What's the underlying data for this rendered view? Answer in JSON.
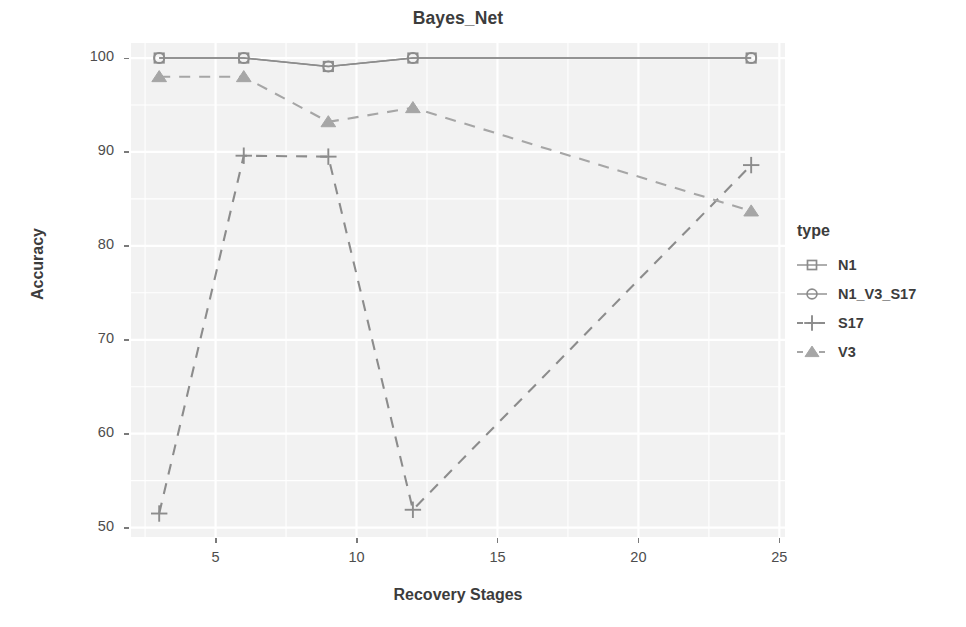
{
  "chart_data": {
    "type": "line",
    "title": "Bayes_Net",
    "xlabel": "Recovery Stages",
    "ylabel": "Accuracy",
    "legend_title": "type",
    "legend_position": "right",
    "grid": true,
    "xlim": [
      2.0,
      25.2
    ],
    "ylim": [
      49.0,
      101.6
    ],
    "xticks": [
      5,
      10,
      15,
      20,
      25
    ],
    "yticks": [
      50,
      60,
      70,
      80,
      90,
      100
    ],
    "x": [
      3,
      6,
      9,
      12,
      24
    ],
    "series": [
      {
        "name": "N1",
        "marker": "square",
        "linestyle": "solid",
        "color": "#8c8c8c",
        "values": [
          100.0,
          100.0,
          99.1,
          100.0,
          100.0
        ]
      },
      {
        "name": "N1_V3_S17",
        "marker": "circle",
        "linestyle": "solid",
        "color": "#8c8c8c",
        "values": [
          100.0,
          100.0,
          99.1,
          100.0,
          100.0
        ]
      },
      {
        "name": "S17",
        "marker": "plus",
        "linestyle": "dashed",
        "color": "#8c8c8c",
        "values": [
          51.5,
          89.6,
          89.5,
          51.9,
          88.6
        ]
      },
      {
        "name": "V3",
        "marker": "triangle",
        "linestyle": "dashed",
        "color": "#a6a6a6",
        "values": [
          98.0,
          98.0,
          93.2,
          94.7,
          83.7
        ]
      }
    ]
  },
  "panel": {
    "background_color": "#f2f2f2",
    "gridline_color": "#ffffff"
  },
  "legend": {
    "title": "type",
    "items": [
      {
        "label": "N1",
        "marker": "square-marker"
      },
      {
        "label": "N1_V3_S17",
        "marker": "circle-marker"
      },
      {
        "label": "S17",
        "marker": "plus-marker"
      },
      {
        "label": "V3",
        "marker": "triangle-marker"
      }
    ]
  },
  "axes": {
    "y_tick_labels": [
      "100",
      "90",
      "80",
      "70",
      "60",
      "50"
    ],
    "x_tick_labels": [
      "5",
      "10",
      "15",
      "20",
      "25"
    ]
  }
}
